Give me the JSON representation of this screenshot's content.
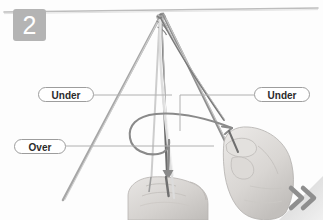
{
  "step": {
    "number": "2",
    "badge_color": "#b4b4b4",
    "badge_text_color": "#ffffff"
  },
  "background": {
    "color": "#fdfdfd",
    "top_rule_color": "#b9b9b9"
  },
  "callouts": [
    {
      "id": "under-left",
      "label": "Under",
      "border_color": "#9d9d9d",
      "text_color": "#2b2b2b",
      "leader_color": "#b0b0b0"
    },
    {
      "id": "under-right",
      "label": "Under",
      "border_color": "#9d9d9d",
      "text_color": "#2b2b2b",
      "leader_color": "#b0b0b0"
    },
    {
      "id": "over",
      "label": "Over",
      "border_color": "#9d9d9d",
      "text_color": "#2b2b2b",
      "leader_color": "#b0b0b0"
    }
  ],
  "illustration": {
    "description": "Two hands tying cords at the apex of a tripod of poles",
    "cord_color_dark": "#6e6e6e",
    "cord_color_light": "#d4d4d4",
    "pole_color": "#9a9a9a",
    "hand_color": "#d8d6d4",
    "hand_outline": "#b3b0ad",
    "motion_arrow_color": "#8a8a8a"
  },
  "progress_chevrons": {
    "count": 2,
    "direction": "right",
    "color": "#8f8f8f",
    "panel_color": "#cfcfcf"
  }
}
